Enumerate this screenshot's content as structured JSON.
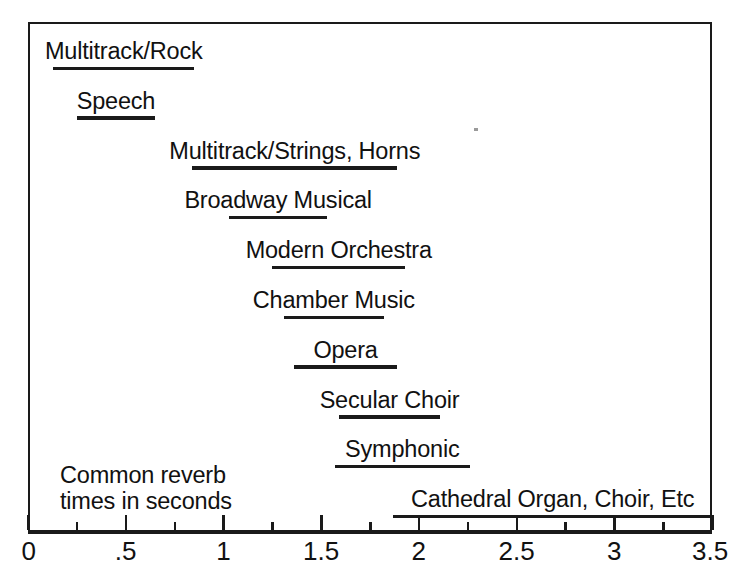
{
  "chart_data": {
    "type": "bar",
    "orientation": "horizontal-range",
    "title": "",
    "xlabel": "",
    "ylabel": "",
    "xlim": [
      0,
      3.5
    ],
    "grid": false,
    "legend": false,
    "axis_ticks": [
      {
        "value": 0,
        "label": "0"
      },
      {
        "value": 0.5,
        "label": ".5"
      },
      {
        "value": 1,
        "label": "1"
      },
      {
        "value": 1.5,
        "label": "1.5"
      },
      {
        "value": 2,
        "label": "2"
      },
      {
        "value": 2.5,
        "label": "2.5"
      },
      {
        "value": 3,
        "label": "3"
      },
      {
        "value": 3.5,
        "label": "3.5"
      }
    ],
    "minor_ticks": [
      0.25,
      0.75,
      1.25,
      1.75,
      2.25,
      2.75,
      3.25
    ],
    "categories": [
      "Multitrack/Rock",
      "Speech",
      "Multitrack/Strings, Horns",
      "Broadway Musical",
      "Modern Orchestra",
      "Chamber Music",
      "Opera",
      "Secular Choir",
      "Symphonic",
      "Cathedral Organ, Choir, Etc"
    ],
    "ranges": [
      {
        "label": "Multitrack/Rock",
        "start": 0.13,
        "end": 0.85
      },
      {
        "label": "Speech",
        "start": 0.25,
        "end": 0.65
      },
      {
        "label": "Multitrack/Strings, Horns",
        "start": 0.84,
        "end": 1.89
      },
      {
        "label": "Broadway Musical",
        "start": 1.03,
        "end": 1.53
      },
      {
        "label": "Modern Orchestra",
        "start": 1.25,
        "end": 1.93
      },
      {
        "label": "Chamber Music",
        "start": 1.31,
        "end": 1.82
      },
      {
        "label": "Opera",
        "start": 1.36,
        "end": 1.89
      },
      {
        "label": "Secular Choir",
        "start": 1.59,
        "end": 2.11
      },
      {
        "label": "Symphonic",
        "start": 1.57,
        "end": 2.26
      },
      {
        "label": "Cathedral Organ, Choir, Etc",
        "start": 1.87,
        "end": 3.5
      }
    ]
  },
  "caption": {
    "text": "Common reverb\ntimes in seconds"
  },
  "colors": {
    "ink": "#1a1a1a",
    "background": "#ffffff"
  }
}
